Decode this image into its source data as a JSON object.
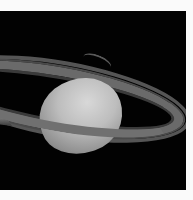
{
  "image": {
    "subject": "Saturn with rings",
    "background_color": "#020202",
    "margin_color": "#fafafa",
    "planet_color": "#c4c4c4",
    "ring_color": "#6a6a6a"
  }
}
